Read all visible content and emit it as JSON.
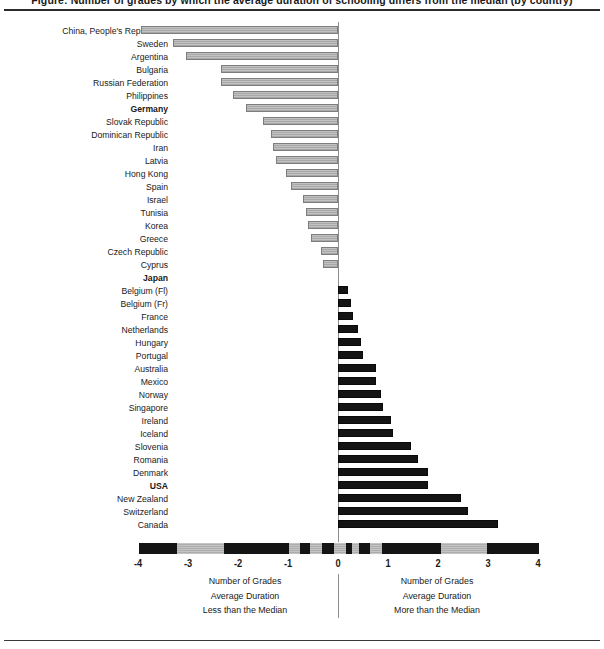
{
  "figure": {
    "clipped_caption": "Figure: Number of grades by which the average duration of schooling differs from the median (by country)",
    "axis_zero_px": 338,
    "px_per_unit": 50
  },
  "chart_data": {
    "type": "bar",
    "orientation": "horizontal",
    "title": "",
    "xlabel": "Number of Grades",
    "ylabel": "",
    "xlim": [
      -4,
      4
    ],
    "xticks": [
      -4,
      -3,
      -2,
      -1,
      0,
      1,
      2,
      3,
      4
    ],
    "xticklabels": [
      "-4",
      "-3",
      "-2",
      "-1",
      "0",
      "1",
      "2",
      "3",
      "4"
    ],
    "grid": false,
    "legend_position": "below-axis",
    "series_colors": {
      "negative": "#a8a8a8",
      "positive": "#141414"
    },
    "legend_left": [
      "Number of Grades",
      "Average Duration",
      "Less than the Median"
    ],
    "legend_right": [
      "Number of Grades",
      "Average Duration",
      "More than the Median"
    ],
    "highlighted_countries": [
      "Germany",
      "Japan",
      "USA"
    ],
    "categories": [
      "China, People's Republic of",
      "Sweden",
      "Argentina",
      "Bulgaria",
      "Russian Federation",
      "Philippines",
      "Germany",
      "Slovak Republic",
      "Dominican Republic",
      "Iran",
      "Latvia",
      "Hong Kong",
      "Spain",
      "Israel",
      "Tunisia",
      "Korea",
      "Greece",
      "Czech Republic",
      "Cyprus",
      "Japan",
      "Belgium (Fl)",
      "Belgium (Fr)",
      "France",
      "Netherlands",
      "Hungary",
      "Portugal",
      "Australia",
      "Mexico",
      "Norway",
      "Singapore",
      "Ireland",
      "Iceland",
      "Slovenia",
      "Romania",
      "Denmark",
      "USA",
      "New Zealand",
      "Switzerland",
      "Canada"
    ],
    "values": [
      -3.95,
      -3.3,
      -3.05,
      -2.35,
      -2.35,
      -2.1,
      -1.85,
      -1.5,
      -1.35,
      -1.3,
      -1.25,
      -1.05,
      -0.95,
      -0.7,
      -0.65,
      -0.6,
      -0.55,
      -0.35,
      -0.3,
      0.0,
      0.2,
      0.25,
      0.3,
      0.4,
      0.45,
      0.5,
      0.75,
      0.75,
      0.85,
      0.9,
      1.05,
      1.1,
      1.45,
      1.6,
      1.8,
      1.8,
      2.45,
      2.6,
      3.2
    ]
  },
  "ruler_segments": [
    {
      "start": -4.0,
      "end": -3.25,
      "shade": "dark"
    },
    {
      "start": -3.25,
      "end": -2.3,
      "shade": "light"
    },
    {
      "start": -2.3,
      "end": -1.0,
      "shade": "dark"
    },
    {
      "start": -1.0,
      "end": -0.78,
      "shade": "light"
    },
    {
      "start": -0.78,
      "end": -0.58,
      "shade": "dark"
    },
    {
      "start": -0.58,
      "end": -0.34,
      "shade": "light"
    },
    {
      "start": -0.34,
      "end": -0.1,
      "shade": "dark"
    },
    {
      "start": -0.1,
      "end": 0.14,
      "shade": "light"
    },
    {
      "start": 0.14,
      "end": 0.26,
      "shade": "dark"
    },
    {
      "start": 0.26,
      "end": 0.4,
      "shade": "light"
    },
    {
      "start": 0.4,
      "end": 0.62,
      "shade": "dark"
    },
    {
      "start": 0.62,
      "end": 0.86,
      "shade": "light"
    },
    {
      "start": 0.86,
      "end": 2.04,
      "shade": "dark"
    },
    {
      "start": 2.04,
      "end": 2.96,
      "shade": "light"
    },
    {
      "start": 2.96,
      "end": 4.0,
      "shade": "dark"
    }
  ]
}
